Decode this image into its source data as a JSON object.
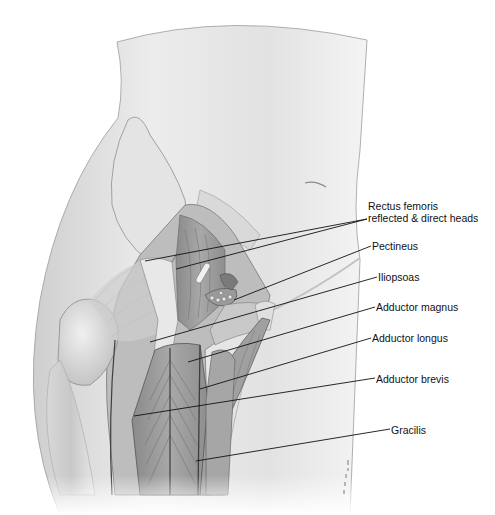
{
  "figure": {
    "type": "anatomical-illustration",
    "colors": {
      "background": "#ffffff",
      "skin": "#dedede",
      "muscle": "#9a9a9a",
      "line": "#111111"
    }
  },
  "labels": [
    {
      "id": "rectus-femoris",
      "line1": "Rectus femoris",
      "line2": "reflected & direct heads",
      "x": 368,
      "y": 200,
      "leaders": [
        {
          "x1": 367,
          "y1": 219,
          "x2": 145,
          "y2": 261
        },
        {
          "x1": 367,
          "y1": 219,
          "x2": 176,
          "y2": 269
        }
      ]
    },
    {
      "id": "pectineus",
      "line1": "Pectineus",
      "x": 372,
      "y": 240,
      "leaders": [
        {
          "x1": 371,
          "y1": 246,
          "x2": 234,
          "y2": 300
        }
      ]
    },
    {
      "id": "iliopsoas",
      "line1": "Iliopsoas",
      "x": 378,
      "y": 270,
      "leaders": [
        {
          "x1": 377,
          "y1": 277,
          "x2": 150,
          "y2": 342
        }
      ]
    },
    {
      "id": "adductor-magnus",
      "line1": "Adductor magnus",
      "x": 376,
      "y": 301,
      "leaders": [
        {
          "x1": 375,
          "y1": 307,
          "x2": 188,
          "y2": 362
        }
      ]
    },
    {
      "id": "adductor-longus",
      "line1": "Adductor longus",
      "x": 372,
      "y": 332,
      "leaders": [
        {
          "x1": 371,
          "y1": 338,
          "x2": 200,
          "y2": 389
        }
      ]
    },
    {
      "id": "adductor-brevis",
      "line1": "Adductor brevis",
      "x": 376,
      "y": 372,
      "leaders": [
        {
          "x1": 375,
          "y1": 378,
          "x2": 134,
          "y2": 416
        }
      ]
    },
    {
      "id": "gracilis",
      "line1": "Gracilis",
      "x": 391,
      "y": 423,
      "leaders": [
        {
          "x1": 390,
          "y1": 429,
          "x2": 196,
          "y2": 461
        }
      ]
    }
  ]
}
